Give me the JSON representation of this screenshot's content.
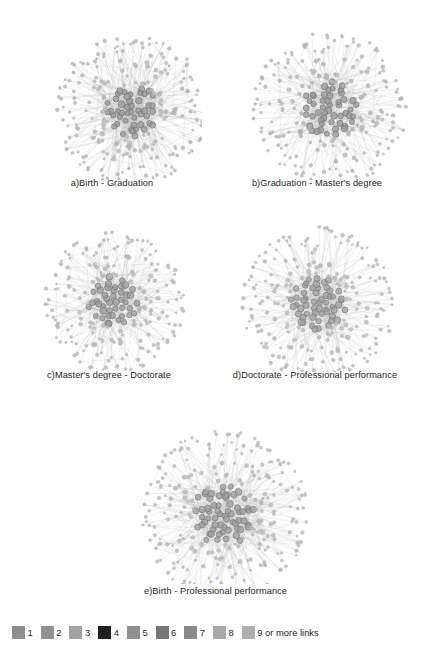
{
  "figure": {
    "background_color": "#ffffff",
    "panels": [
      {
        "id": "a",
        "caption": "a)Birth - Graduation",
        "graph": {
          "seed": 1207,
          "node_count": 268,
          "core_count": 46,
          "core_radius": 26,
          "mid_radius": 52,
          "outer_radius": 76,
          "center_x": 110,
          "center_y": 97,
          "hub_node_color": "#9a9a9a",
          "hub_node_stroke": "#6f6f6f",
          "leaf_node_color": "#b4b4b4",
          "edge_color": "#b9b9b9"
        }
      },
      {
        "id": "b",
        "caption": "b)Graduation - Master's degree",
        "graph": {
          "seed": 4413,
          "node_count": 258,
          "core_count": 50,
          "core_radius": 28,
          "mid_radius": 54,
          "outer_radius": 78,
          "center_x": 108,
          "center_y": 96,
          "hub_node_color": "#9a9a9a",
          "hub_node_stroke": "#6f6f6f",
          "leaf_node_color": "#b4b4b4",
          "edge_color": "#bcbcbc"
        }
      },
      {
        "id": "c",
        "caption": "c)Master's degree - Doctorate",
        "graph": {
          "seed": 8821,
          "node_count": 240,
          "core_count": 44,
          "core_radius": 25,
          "mid_radius": 48,
          "outer_radius": 70,
          "center_x": 100,
          "center_y": 90,
          "hub_node_color": "#9c9c9c",
          "hub_node_stroke": "#717171",
          "leaf_node_color": "#b6b6b6",
          "edge_color": "#bfbfbf"
        }
      },
      {
        "id": "d",
        "caption": "d)Doctorate - Professional performance",
        "graph": {
          "seed": 3357,
          "node_count": 276,
          "core_count": 56,
          "core_radius": 27,
          "mid_radius": 52,
          "outer_radius": 77,
          "center_x": 106,
          "center_y": 92,
          "hub_node_color": "#a0a0a0",
          "hub_node_stroke": "#777777",
          "leaf_node_color": "#b8b8b8",
          "edge_color": "#c2c2c2"
        }
      },
      {
        "id": "e",
        "caption": "e)Birth - Professional performance",
        "graph": {
          "seed": 6142,
          "node_count": 310,
          "core_count": 62,
          "core_radius": 30,
          "mid_radius": 58,
          "outer_radius": 84,
          "center_x": 116,
          "center_y": 100,
          "hub_node_color": "#9e9e9e",
          "hub_node_stroke": "#747474",
          "leaf_node_color": "#b7b7b7",
          "edge_color": "#c0c0c0"
        }
      }
    ]
  },
  "legend": {
    "entries": [
      {
        "label": "1",
        "color": "#8e8e8e"
      },
      {
        "label": "2",
        "color": "#919191"
      },
      {
        "label": "3",
        "color": "#a3a3a3"
      },
      {
        "label": "4",
        "color": "#231f20"
      },
      {
        "label": "5",
        "color": "#8f8f8f"
      },
      {
        "label": "6",
        "color": "#767676"
      },
      {
        "label": "7",
        "color": "#8a8a8a"
      },
      {
        "label": "8",
        "color": "#a9a9a9"
      },
      {
        "label": "9 or more links",
        "color": "#aeaeae"
      }
    ]
  },
  "chart_data": {
    "type": "diagram",
    "subtype": "social-network-graph-grid",
    "title": "",
    "panel_count": 5,
    "panels": [
      {
        "id": "a",
        "label": "a)Birth - Graduation",
        "nodes": 268,
        "core_nodes": 46
      },
      {
        "id": "b",
        "label": "b)Graduation - Master's degree",
        "nodes": 258,
        "core_nodes": 50
      },
      {
        "id": "c",
        "label": "c)Master's degree - Doctorate",
        "nodes": 240,
        "core_nodes": 44
      },
      {
        "id": "d",
        "label": "d)Doctorate - Professional performance",
        "nodes": 276,
        "core_nodes": 56
      },
      {
        "id": "e",
        "label": "e)Birth - Professional performance",
        "nodes": 310,
        "core_nodes": 62
      }
    ],
    "legend_title": "",
    "legend_entries": [
      "1",
      "2",
      "3",
      "4",
      "5",
      "6",
      "7",
      "8",
      "9 or more links"
    ],
    "legend_position": "bottom"
  },
  "layout": {
    "panel_boxes": [
      {
        "left": 22,
        "top": 14,
        "width": 180,
        "height": 196,
        "caption_top": 178
      },
      {
        "left": 222,
        "top": 14,
        "width": 190,
        "height": 196,
        "caption_top": 178
      },
      {
        "left": 14,
        "top": 208,
        "width": 190,
        "height": 190,
        "caption_top": 370
      },
      {
        "left": 214,
        "top": 208,
        "width": 205,
        "height": 190,
        "caption_top": 370
      },
      {
        "left": 110,
        "top": 414,
        "width": 210,
        "height": 200,
        "caption_top": 586
      }
    ]
  }
}
